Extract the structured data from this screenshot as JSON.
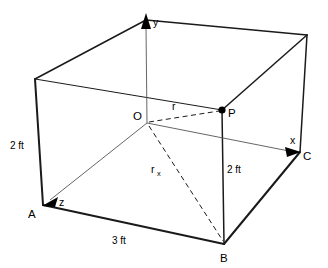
{
  "figure": {
    "type": "3d-geometry-diagram",
    "background_color": "#ffffff",
    "line_color": "#1a1a1a"
  },
  "axes": [
    {
      "id": "y",
      "label": "y",
      "direction": "up",
      "x": 153,
      "y": 21
    },
    {
      "id": "x",
      "label": "x",
      "direction": "right",
      "x": 292,
      "y": 141
    },
    {
      "id": "z",
      "label": "z",
      "direction": "down-left",
      "x": 61,
      "y": 202
    }
  ],
  "points": [
    {
      "id": "O",
      "label": "O",
      "x": 137,
      "y": 117,
      "marker": "none",
      "role": "origin"
    },
    {
      "id": "P",
      "label": "P",
      "x": 230,
      "y": 115,
      "marker": "filled",
      "role": "point"
    },
    {
      "id": "A",
      "label": "A",
      "x": 31,
      "y": 215,
      "marker": "none",
      "role": "corner"
    },
    {
      "id": "B",
      "label": "B",
      "x": 221,
      "y": 259,
      "marker": "none",
      "role": "corner"
    },
    {
      "id": "C",
      "label": "C",
      "x": 304,
      "y": 158,
      "marker": "none",
      "role": "corner"
    }
  ],
  "vectors": [
    {
      "id": "r",
      "label": "r",
      "style": "dashed",
      "from": "O",
      "to": "P",
      "label_x": 172,
      "label_y": 108
    },
    {
      "id": "rx",
      "label": "r",
      "subscript": "x",
      "style": "dashed",
      "from": "O",
      "to": "B",
      "label_x": 152,
      "label_y": 171
    }
  ],
  "dimensions": [
    {
      "id": "height-left",
      "label": "2 ft",
      "x": 11,
      "y": 146,
      "edge": "A-to-top-left-front"
    },
    {
      "id": "height-right",
      "label": "2 ft",
      "x": 228,
      "y": 170,
      "edge": "P-to-B"
    },
    {
      "id": "depth-front",
      "label": "3 ft",
      "x": 114,
      "y": 241,
      "edge": "A-to-B"
    }
  ],
  "geometry": {
    "vertices": {
      "top_back": [
        146,
        20
      ],
      "top_left": [
        35,
        79
      ],
      "top_right": [
        307,
        35
      ],
      "top_front": [
        222,
        110
      ],
      "bottom_left": [
        43,
        205
      ],
      "bottom_front": [
        224,
        244
      ],
      "bottom_right": [
        300,
        152
      ],
      "origin": [
        147,
        123
      ]
    }
  }
}
